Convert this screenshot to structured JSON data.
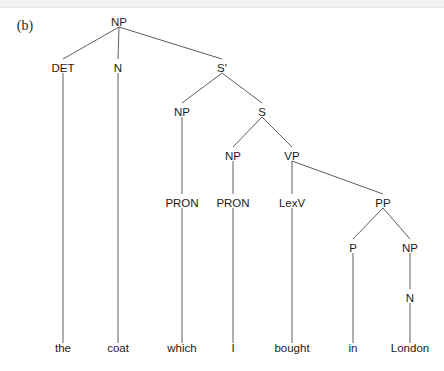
{
  "figure": {
    "label": "(b)",
    "label_x": 25,
    "label_y": 30,
    "width": 444,
    "height": 371,
    "background": "#ffffff",
    "line_color": "#4a4a4a",
    "text_color": "#1b1b1b"
  },
  "chart_data": {
    "type": "diagram",
    "diagram_kind": "syntax-tree",
    "title": "(b)",
    "sentence": "the coat which I bought in London",
    "nodes": [
      {
        "id": "NP0",
        "label": "NP",
        "x": 119,
        "y": 22,
        "depth": 0
      },
      {
        "id": "DET1",
        "label": "DET",
        "x": 63,
        "y": 68,
        "depth": 1
      },
      {
        "id": "N1",
        "label": "N",
        "x": 118,
        "y": 68,
        "depth": 1
      },
      {
        "id": "SBAR1",
        "label": "S'",
        "x": 222,
        "y": 68,
        "depth": 1
      },
      {
        "id": "NP2",
        "label": "NP",
        "x": 182,
        "y": 112,
        "depth": 2
      },
      {
        "id": "S2",
        "label": "S",
        "x": 262,
        "y": 112,
        "depth": 2
      },
      {
        "id": "NP3",
        "label": "NP",
        "x": 233,
        "y": 156,
        "depth": 3
      },
      {
        "id": "VP3",
        "label": "VP",
        "x": 292,
        "y": 156,
        "depth": 3
      },
      {
        "id": "PRON4a",
        "label": "PRON",
        "x": 182,
        "y": 203,
        "depth": 4
      },
      {
        "id": "PRON4b",
        "label": "PRON",
        "x": 233,
        "y": 203,
        "depth": 4
      },
      {
        "id": "LEXV4",
        "label": "LexV",
        "x": 292,
        "y": 203,
        "depth": 4
      },
      {
        "id": "PP4",
        "label": "PP",
        "x": 383,
        "y": 203,
        "depth": 4
      },
      {
        "id": "P5",
        "label": "P",
        "x": 353,
        "y": 248,
        "depth": 5
      },
      {
        "id": "NP5",
        "label": "NP",
        "x": 410,
        "y": 248,
        "depth": 5
      },
      {
        "id": "N6",
        "label": "N",
        "x": 410,
        "y": 298,
        "depth": 6
      }
    ],
    "terminals": [
      {
        "id": "T1",
        "label": "the",
        "x": 63,
        "y": 352,
        "parent": "DET1"
      },
      {
        "id": "T2",
        "label": "coat",
        "x": 118,
        "y": 352,
        "parent": "N1"
      },
      {
        "id": "T3",
        "label": "which",
        "x": 182,
        "y": 352,
        "parent": "PRON4a"
      },
      {
        "id": "T4",
        "label": "I",
        "x": 233,
        "y": 352,
        "parent": "PRON4b"
      },
      {
        "id": "T5",
        "label": "bought",
        "x": 292,
        "y": 352,
        "parent": "LEXV4"
      },
      {
        "id": "T6",
        "label": "in",
        "x": 353,
        "y": 352,
        "parent": "P5"
      },
      {
        "id": "T7",
        "label": "London",
        "x": 410,
        "y": 352,
        "parent": "N6"
      }
    ],
    "edges": [
      {
        "from": "NP0",
        "to": "DET1"
      },
      {
        "from": "NP0",
        "to": "N1"
      },
      {
        "from": "NP0",
        "to": "SBAR1"
      },
      {
        "from": "SBAR1",
        "to": "NP2"
      },
      {
        "from": "SBAR1",
        "to": "S2"
      },
      {
        "from": "S2",
        "to": "NP3"
      },
      {
        "from": "S2",
        "to": "VP3"
      },
      {
        "from": "NP2",
        "to": "PRON4a"
      },
      {
        "from": "NP3",
        "to": "PRON4b"
      },
      {
        "from": "VP3",
        "to": "LEXV4"
      },
      {
        "from": "VP3",
        "to": "PP4"
      },
      {
        "from": "PP4",
        "to": "P5"
      },
      {
        "from": "PP4",
        "to": "NP5"
      },
      {
        "from": "NP5",
        "to": "N6"
      },
      {
        "from": "DET1",
        "to": "T1"
      },
      {
        "from": "N1",
        "to": "T2"
      },
      {
        "from": "PRON4a",
        "to": "T3"
      },
      {
        "from": "PRON4b",
        "to": "T4"
      },
      {
        "from": "LEXV4",
        "to": "T5"
      },
      {
        "from": "P5",
        "to": "T6"
      },
      {
        "from": "N6",
        "to": "T7"
      }
    ]
  }
}
